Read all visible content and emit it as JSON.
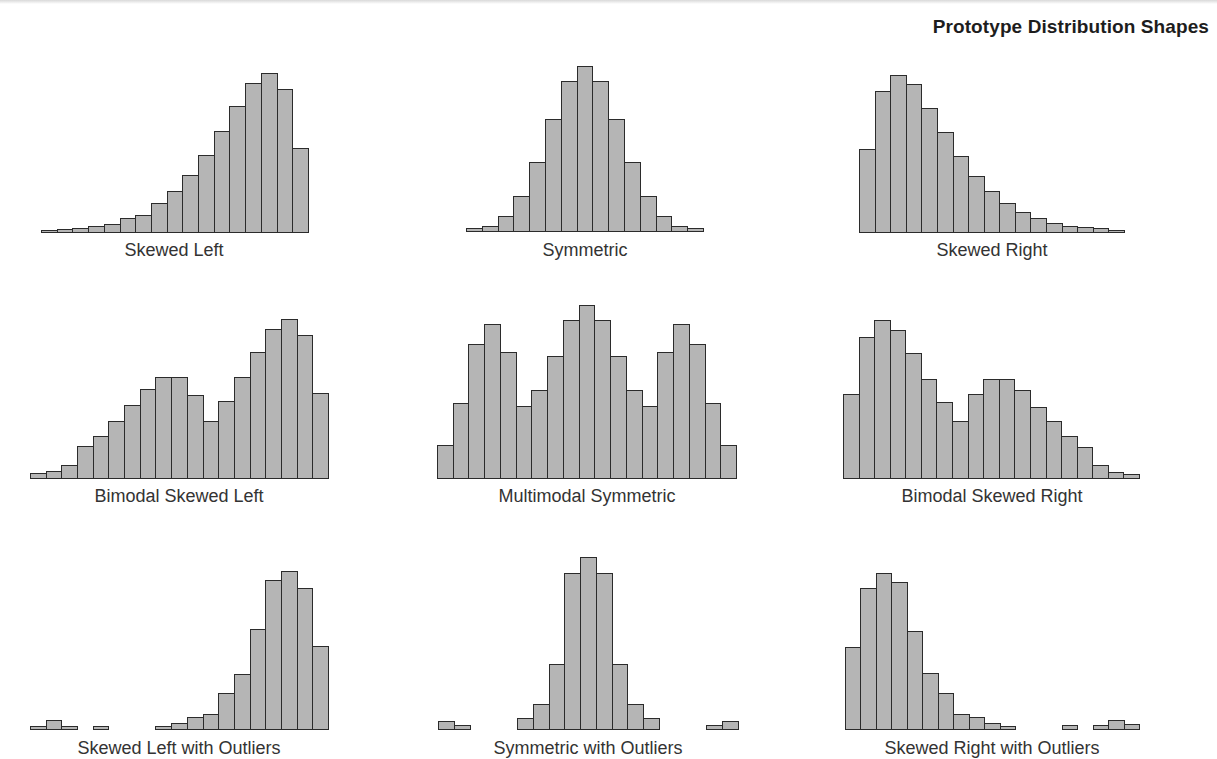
{
  "title": "Prototype Distribution Shapes",
  "colors": {
    "bar_fill": "#b5b5b5",
    "bar_edge": "#2b2b2b",
    "background": "#ffffff",
    "label": "#333333"
  },
  "chart_data": [
    {
      "type": "bar",
      "title": "Skewed Left",
      "row": 0,
      "col": 0,
      "geometry": {
        "x0": 41,
        "x1": 308,
        "baseline": 232
      },
      "values": [
        2,
        3,
        4,
        6,
        8,
        14,
        17,
        29,
        41,
        57,
        77,
        101,
        126,
        149,
        159,
        143,
        84
      ]
    },
    {
      "type": "bar",
      "title": "Symmetric",
      "row": 0,
      "col": 1,
      "geometry": {
        "x0": 466,
        "x1": 703,
        "baseline": 231
      },
      "values": [
        3,
        5,
        15,
        35,
        69,
        112,
        150,
        165,
        150,
        112,
        69,
        35,
        15,
        5,
        3
      ]
    },
    {
      "type": "bar",
      "title": "Skewed Right",
      "row": 0,
      "col": 2,
      "geometry": {
        "x0": 859,
        "x1": 1124,
        "baseline": 232
      },
      "values": [
        83,
        141,
        157,
        148,
        124,
        100,
        76,
        56,
        41,
        29,
        20,
        14,
        9,
        6,
        5,
        4,
        2
      ]
    },
    {
      "type": "bar",
      "title": "Bimodal Skewed Left",
      "row": 1,
      "col": 0,
      "geometry": {
        "x0": 30,
        "x1": 328,
        "baseline": 478
      },
      "values": [
        5,
        7,
        13,
        32,
        42,
        57,
        73,
        89,
        101,
        101,
        83,
        57,
        77,
        101,
        126,
        149,
        159,
        143,
        85
      ]
    },
    {
      "type": "bar",
      "title": "Multimodal Symmetric",
      "row": 1,
      "col": 1,
      "geometry": {
        "x0": 437,
        "x1": 736,
        "baseline": 478
      },
      "values": [
        33,
        75,
        134,
        154,
        126,
        72,
        88,
        122,
        158,
        173,
        158,
        122,
        88,
        72,
        126,
        154,
        134,
        75,
        33
      ]
    },
    {
      "type": "bar",
      "title": "Bimodal Skewed Right",
      "row": 1,
      "col": 2,
      "geometry": {
        "x0": 843,
        "x1": 1139,
        "baseline": 478
      },
      "values": [
        84,
        141,
        158,
        148,
        125,
        99,
        76,
        57,
        84,
        99,
        99,
        88,
        71,
        57,
        42,
        31,
        13,
        6,
        4
      ]
    },
    {
      "type": "bar",
      "title": "Skewed Left with Outliers",
      "row": 2,
      "col": 0,
      "geometry": {
        "x0": 30,
        "x1": 328,
        "baseline": 729
      },
      "values": [
        3,
        9,
        3,
        0,
        3,
        0,
        0,
        0,
        3,
        6,
        12,
        15,
        36,
        55,
        100,
        149,
        158,
        141,
        83
      ]
    },
    {
      "type": "bar",
      "title": "Symmetric with Outliers",
      "row": 2,
      "col": 1,
      "geometry": {
        "x0": 438,
        "x1": 738,
        "baseline": 729
      },
      "values": [
        8,
        4,
        0,
        0,
        0,
        11,
        25,
        65,
        156,
        172,
        156,
        65,
        25,
        11,
        0,
        0,
        0,
        4,
        8
      ]
    },
    {
      "type": "bar",
      "title": "Skewed Right with Outliers",
      "row": 2,
      "col": 2,
      "geometry": {
        "x0": 845,
        "x1": 1139,
        "baseline": 729
      },
      "values": [
        82,
        141,
        156,
        147,
        98,
        56,
        36,
        15,
        12,
        6,
        3,
        0,
        0,
        0,
        4,
        0,
        4,
        9,
        5
      ]
    }
  ],
  "labels": {
    "skewed_left": "Skewed Left",
    "symmetric": "Symmetric",
    "skewed_right": "Skewed Right",
    "bimodal_skewed_left": "Bimodal Skewed Left",
    "multimodal_symmetric": "Multimodal Symmetric",
    "bimodal_skewed_right": "Bimodal Skewed Right",
    "skewed_left_outliers": "Skewed Left with Outliers",
    "symmetric_outliers": "Symmetric with Outliers",
    "skewed_right_outliers": "Skewed Right with Outliers"
  }
}
